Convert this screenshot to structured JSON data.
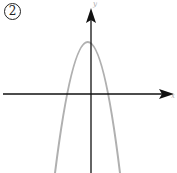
{
  "figure": {
    "label": "2",
    "x_axis_label": "x",
    "y_axis_label": "y",
    "colors": {
      "axes": "#111111",
      "curve": "#b0b0b0",
      "background": "#ffffff"
    },
    "curve": {
      "type": "parabola",
      "opens": "down",
      "vertex_position": "slightly left of y-axis, above x-axis",
      "x_intercepts": "one negative, one positive"
    }
  }
}
